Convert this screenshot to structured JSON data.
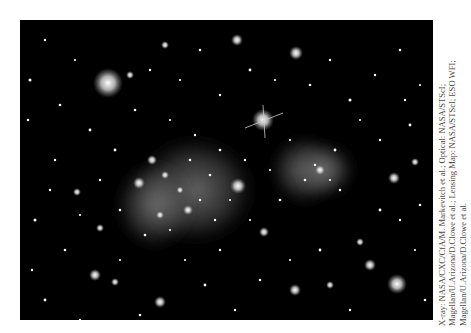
{
  "image": {
    "subject": "galaxy cluster composite: optical star field with diffuse pink/gray X-ray gas clouds",
    "background": "#000000"
  },
  "credit": {
    "lines": [
      "X-ray: NASA/CXC/CfA/M. Markevitch et al.; Optical: NASA/STScI;",
      "Magellan/U.Arizona/D.Clowe et al.; Lensing Map: NASA/STScI; ESO WFI;",
      "Magellan/U.Arizona/D.Clowe et al."
    ]
  }
}
